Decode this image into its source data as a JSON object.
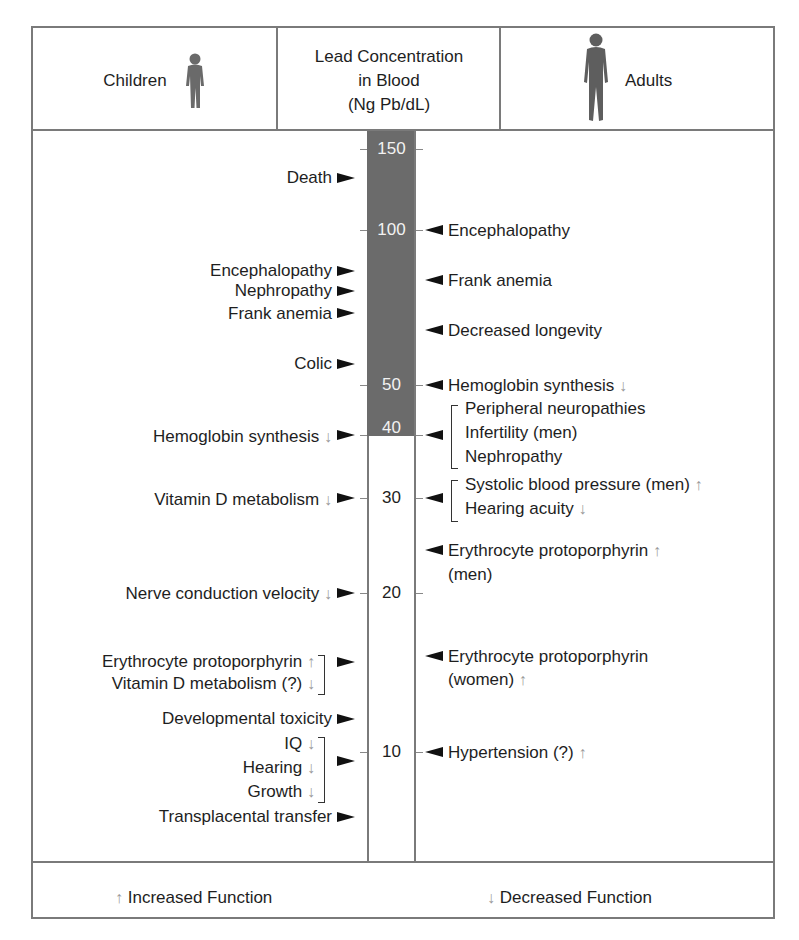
{
  "header": {
    "children_label": "Children",
    "center_lines": [
      "Lead Concentration",
      "in Blood",
      "(Ng Pb/dL)"
    ],
    "adults_label": "Adults"
  },
  "icons": {
    "children_figure": "child-silhouette-icon",
    "adult_figure": "adult-silhouette-icon",
    "arrow_right": "right-pointer-icon",
    "arrow_left": "left-pointer-icon",
    "up_arrow": "↑",
    "down_arrow": "↓"
  },
  "colors": {
    "scale_shaded": "#6b6b6b",
    "border": "#7a7a7a",
    "text": "#1e1e1e",
    "function_arrow": "#9a9a9a"
  },
  "scale": {
    "ticks": [
      "150",
      "100",
      "50",
      "40",
      "30",
      "20",
      "10"
    ],
    "shaded_from": "40",
    "shaded_to": "150"
  },
  "children_effects": [
    {
      "text": "Death",
      "mark": ""
    },
    {
      "text": "Encephalopathy",
      "mark": ""
    },
    {
      "text": "Nephropathy",
      "mark": ""
    },
    {
      "text": "Frank anemia",
      "mark": ""
    },
    {
      "text": "Colic",
      "mark": ""
    },
    {
      "text": "Hemoglobin synthesis",
      "mark": "↓"
    },
    {
      "text": "Vitamin D metabolism",
      "mark": "↓"
    },
    {
      "text": "Nerve conduction velocity",
      "mark": "↓"
    },
    {
      "text": "Erythrocyte protoporphyrin",
      "mark": "↑"
    },
    {
      "text": "Vitamin D metabolism (?)",
      "mark": "↓"
    },
    {
      "text": "Developmental toxicity",
      "mark": ""
    },
    {
      "text": "IQ",
      "mark": "↓"
    },
    {
      "text": "Hearing",
      "mark": "↓"
    },
    {
      "text": "Growth",
      "mark": "↓"
    },
    {
      "text": "Transplacental transfer",
      "mark": ""
    }
  ],
  "adult_effects": [
    {
      "text": "Encephalopathy",
      "mark": ""
    },
    {
      "text": "Frank anemia",
      "mark": ""
    },
    {
      "text": "Decreased longevity",
      "mark": ""
    },
    {
      "text": "Hemoglobin synthesis",
      "mark": "↓"
    },
    {
      "text": "Peripheral neuropathies",
      "mark": ""
    },
    {
      "text": "Infertility (men)",
      "mark": ""
    },
    {
      "text": "Nephropathy",
      "mark": ""
    },
    {
      "text": "Systolic blood pressure (men)",
      "mark": "↑"
    },
    {
      "text": "Hearing acuity",
      "mark": "↓"
    },
    {
      "text": "Erythrocyte protoporphyrin",
      "mark": "↑"
    },
    {
      "text": "(men)",
      "mark": ""
    },
    {
      "text": "Erythrocyte protoporphyrin",
      "mark": ""
    },
    {
      "text": "(women)",
      "mark": "↑"
    },
    {
      "text": "Hypertension (?)",
      "mark": "↑"
    }
  ],
  "legend": {
    "increased_symbol": "↑",
    "increased_label": "Increased Function",
    "decreased_symbol": "↓",
    "decreased_label": "Decreased Function"
  }
}
